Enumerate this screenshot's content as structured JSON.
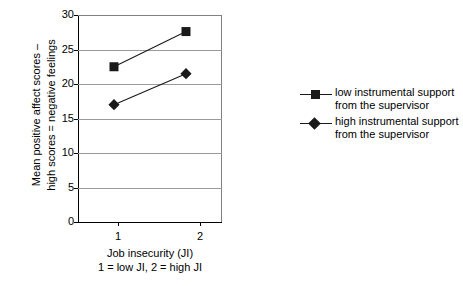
{
  "chart_data": {
    "type": "line",
    "title": "",
    "subtitle": "",
    "xlabel": "Job insecurity (JI)",
    "xlabel_note": "1 = low JI, 2 = high JI",
    "ylabel_line1": "Mean positive affect scores –",
    "ylabel_line2": "high scores = negative feelings",
    "categories": [
      "1",
      "2"
    ],
    "x": [
      1,
      2
    ],
    "xlim": [
      0.5,
      2.5
    ],
    "ylim": [
      0,
      30
    ],
    "yticks": [
      0,
      5,
      10,
      15,
      20,
      25,
      30
    ],
    "ytick_labels": [
      "0",
      "5",
      "10",
      "15",
      "20",
      "25",
      "30"
    ],
    "grid": true,
    "grid_axis": "y",
    "legend_position": "right",
    "series": [
      {
        "name": "low instrumental support from the supervisor",
        "name_line1": "low instrumental support",
        "name_line2": "from the supervisor",
        "marker": "square",
        "color": "#1a1a1a",
        "values": [
          22.5,
          27.6
        ]
      },
      {
        "name": "high instrumental support from the supervisor",
        "name_line1": "high instrumental support",
        "name_line2": "from the supervisor",
        "marker": "diamond",
        "color": "#1a1a1a",
        "values": [
          17.0,
          21.5
        ]
      }
    ]
  },
  "axes": {
    "ytick_0": "0",
    "ytick_1": "5",
    "ytick_2": "10",
    "ytick_3": "15",
    "ytick_4": "20",
    "ytick_5": "25",
    "ytick_6": "30",
    "xtick_0": "1",
    "xtick_1": "2"
  },
  "legend": {
    "series_1_line1": "low instrumental support",
    "series_1_line2": "from the supervisor",
    "series_2_line1": "high instrumental support",
    "series_2_line2": "from the supervisor"
  }
}
